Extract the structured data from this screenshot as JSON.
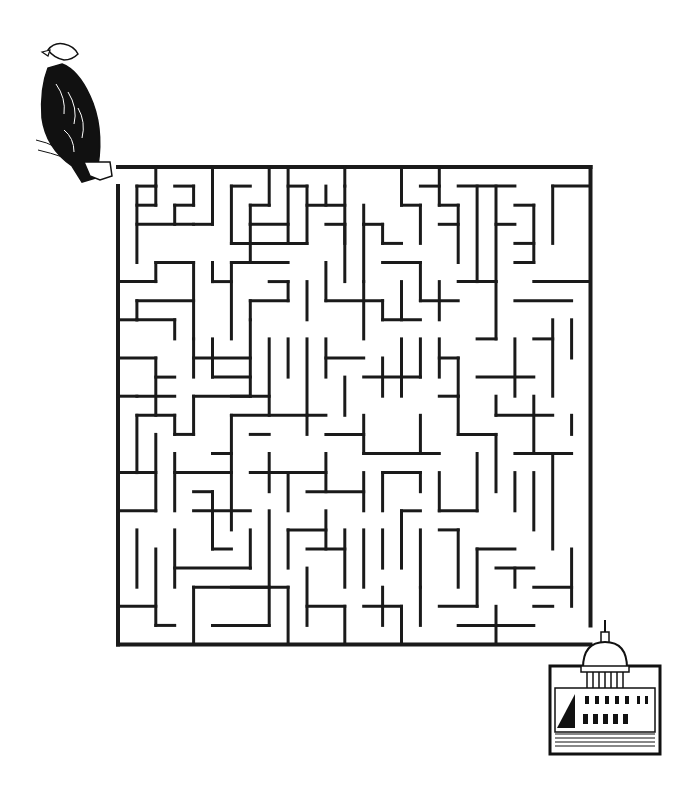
{
  "puzzle": {
    "type": "maze",
    "title": "",
    "start_marker": {
      "icon": "bald-eagle-icon",
      "position": "top-left"
    },
    "end_marker": {
      "icon": "us-capitol-building-icon",
      "position": "bottom-right"
    },
    "grid": {
      "cols": 25,
      "rows": 25,
      "origin_x": 118,
      "origin_y": 167,
      "cell_w": 18.9,
      "cell_h": 19.1
    },
    "colors": {
      "wall": "#1a1a1a",
      "background": "#ffffff"
    },
    "entrance": {
      "side": "left",
      "row": 0
    },
    "exit": {
      "side": "right",
      "row": 24
    },
    "walls": [
      [
        0,
        0,
        25,
        0
      ],
      [
        0,
        1,
        0,
        25
      ],
      [
        0,
        25,
        25,
        25
      ],
      [
        25,
        0,
        25,
        24
      ],
      [
        1,
        1,
        2,
        1
      ],
      [
        1,
        1,
        1,
        5
      ],
      [
        2,
        0,
        2,
        1
      ],
      [
        2,
        1,
        2,
        2
      ],
      [
        1,
        2,
        2,
        2
      ],
      [
        1,
        3,
        4,
        3
      ],
      [
        3,
        1,
        4,
        1
      ],
      [
        4,
        1,
        4,
        2
      ],
      [
        3,
        2,
        4,
        2
      ],
      [
        3,
        2,
        3,
        3
      ],
      [
        5,
        0,
        5,
        3
      ],
      [
        4,
        3,
        5,
        3
      ],
      [
        6,
        1,
        7,
        1
      ],
      [
        6,
        1,
        6,
        4
      ],
      [
        7,
        2,
        8,
        2
      ],
      [
        7,
        2,
        7,
        3
      ],
      [
        8,
        0,
        8,
        2
      ],
      [
        6,
        4,
        10,
        4
      ],
      [
        9,
        0,
        9,
        4
      ],
      [
        9,
        1,
        10,
        1
      ],
      [
        10,
        1,
        10,
        4
      ],
      [
        10,
        2,
        12,
        2
      ],
      [
        11,
        1,
        11,
        2
      ],
      [
        7,
        3,
        9,
        3
      ],
      [
        7,
        3,
        7,
        5
      ],
      [
        12,
        0,
        12,
        1
      ],
      [
        12,
        1,
        12,
        4
      ],
      [
        11,
        3,
        12,
        3
      ],
      [
        12,
        3,
        12,
        6
      ],
      [
        13,
        3,
        14,
        3
      ],
      [
        13,
        2,
        13,
        3
      ],
      [
        13,
        3,
        13,
        6
      ],
      [
        14,
        4,
        14,
        3
      ],
      [
        14,
        4,
        15,
        4
      ],
      [
        15,
        0,
        15,
        2
      ],
      [
        15,
        2,
        16,
        2
      ],
      [
        16,
        2,
        16,
        4
      ],
      [
        16,
        1,
        17,
        1
      ],
      [
        14,
        5,
        16,
        5
      ],
      [
        16,
        5,
        16,
        7
      ],
      [
        17,
        0,
        17,
        2
      ],
      [
        17,
        2,
        18,
        2
      ],
      [
        18,
        2,
        18,
        5
      ],
      [
        17,
        3,
        18,
        3
      ],
      [
        19,
        1,
        19,
        6
      ],
      [
        18,
        1,
        21,
        1
      ],
      [
        20,
        1,
        20,
        6
      ],
      [
        20,
        3,
        21,
        3
      ],
      [
        21,
        2,
        22,
        2
      ],
      [
        22,
        2,
        22,
        5
      ],
      [
        21,
        4,
        22,
        4
      ],
      [
        21,
        5,
        22,
        5
      ],
      [
        23,
        1,
        23,
        4
      ],
      [
        23,
        1,
        25,
        1
      ],
      [
        0,
        6,
        2,
        6
      ],
      [
        2,
        5,
        2,
        6
      ],
      [
        2,
        5,
        4,
        5
      ],
      [
        4,
        5,
        4,
        9
      ],
      [
        1,
        7,
        4,
        7
      ],
      [
        1,
        7,
        1,
        8
      ],
      [
        1,
        8,
        3,
        8
      ],
      [
        3,
        8,
        3,
        9
      ],
      [
        5,
        5,
        5,
        6
      ],
      [
        5,
        6,
        6,
        6
      ],
      [
        6,
        5,
        6,
        9
      ],
      [
        6,
        5,
        9,
        5
      ],
      [
        7,
        7,
        7,
        8
      ],
      [
        7,
        7,
        9,
        7
      ],
      [
        9,
        7,
        9,
        6
      ],
      [
        8,
        6,
        9,
        6
      ],
      [
        11,
        7,
        14,
        7
      ],
      [
        11,
        5,
        11,
        7
      ],
      [
        10,
        6,
        10,
        8
      ],
      [
        13,
        6,
        13,
        9
      ],
      [
        14,
        7,
        14,
        8
      ],
      [
        14,
        8,
        16,
        8
      ],
      [
        15,
        6,
        15,
        8
      ],
      [
        16,
        7,
        18,
        7
      ],
      [
        17,
        6,
        17,
        8
      ],
      [
        18,
        6,
        20,
        6
      ],
      [
        20,
        6,
        20,
        9
      ],
      [
        20,
        9,
        19,
        9
      ],
      [
        21,
        7,
        24,
        7
      ],
      [
        22,
        6,
        25,
        6
      ],
      [
        24,
        8,
        24,
        10
      ],
      [
        0,
        8,
        1,
        8
      ],
      [
        0,
        10,
        2,
        10
      ],
      [
        2,
        10,
        2,
        13
      ],
      [
        2,
        11,
        3,
        11
      ],
      [
        1,
        12,
        3,
        12
      ],
      [
        0,
        12,
        1,
        12
      ],
      [
        4,
        9,
        4,
        11
      ],
      [
        4,
        10,
        7,
        10
      ],
      [
        5,
        9,
        5,
        11
      ],
      [
        5,
        11,
        7,
        11
      ],
      [
        7,
        8,
        7,
        12
      ],
      [
        6,
        12,
        8,
        12
      ],
      [
        8,
        9,
        8,
        13
      ],
      [
        9,
        9,
        9,
        11
      ],
      [
        10,
        9,
        10,
        13
      ],
      [
        11,
        9,
        11,
        11
      ],
      [
        11,
        10,
        13,
        10
      ],
      [
        12,
        11,
        12,
        13
      ],
      [
        14,
        10,
        14,
        12
      ],
      [
        13,
        11,
        16,
        11
      ],
      [
        15,
        9,
        15,
        12
      ],
      [
        16,
        9,
        16,
        11
      ],
      [
        17,
        9,
        17,
        11
      ],
      [
        17,
        10,
        18,
        10
      ],
      [
        18,
        10,
        18,
        12
      ],
      [
        19,
        11,
        22,
        11
      ],
      [
        21,
        9,
        21,
        12
      ],
      [
        22,
        9,
        23,
        9
      ],
      [
        23,
        8,
        23,
        12
      ],
      [
        4,
        12,
        7,
        12
      ],
      [
        4,
        12,
        4,
        14
      ],
      [
        1,
        13,
        3,
        13
      ],
      [
        1,
        13,
        1,
        16
      ],
      [
        3,
        13,
        3,
        14
      ],
      [
        3,
        14,
        4,
        14
      ],
      [
        6,
        13,
        11,
        13
      ],
      [
        6,
        13,
        6,
        19
      ],
      [
        5,
        15,
        6,
        15
      ],
      [
        7,
        14,
        8,
        14
      ],
      [
        10,
        13,
        10,
        14
      ],
      [
        11,
        14,
        13,
        14
      ],
      [
        13,
        13,
        13,
        15
      ],
      [
        13,
        15,
        17,
        15
      ],
      [
        16,
        13,
        16,
        15
      ],
      [
        17,
        12,
        18,
        12
      ],
      [
        18,
        12,
        18,
        14
      ],
      [
        18,
        14,
        20,
        14
      ],
      [
        20,
        12,
        20,
        13
      ],
      [
        20,
        13,
        23,
        13
      ],
      [
        22,
        12,
        22,
        15
      ],
      [
        21,
        15,
        24,
        15
      ],
      [
        24,
        13,
        24,
        14
      ],
      [
        0,
        16,
        2,
        16
      ],
      [
        2,
        14,
        2,
        18
      ],
      [
        3,
        15,
        3,
        18
      ],
      [
        3,
        16,
        6,
        16
      ],
      [
        4,
        17,
        5,
        17
      ],
      [
        5,
        17,
        5,
        20
      ],
      [
        8,
        15,
        8,
        17
      ],
      [
        7,
        16,
        11,
        16
      ],
      [
        9,
        16,
        9,
        18
      ],
      [
        11,
        15,
        11,
        17
      ],
      [
        10,
        17,
        13,
        17
      ],
      [
        13,
        16,
        13,
        18
      ],
      [
        14,
        16,
        16,
        16
      ],
      [
        14,
        16,
        14,
        18
      ],
      [
        16,
        16,
        16,
        17
      ],
      [
        17,
        16,
        17,
        18
      ],
      [
        17,
        18,
        19,
        18
      ],
      [
        19,
        15,
        19,
        18
      ],
      [
        20,
        14,
        20,
        17
      ],
      [
        21,
        16,
        21,
        18
      ],
      [
        22,
        16,
        22,
        19
      ],
      [
        23,
        15,
        23,
        20
      ],
      [
        0,
        18,
        2,
        18
      ],
      [
        1,
        19,
        1,
        22
      ],
      [
        2,
        20,
        2,
        24
      ],
      [
        3,
        19,
        3,
        22
      ],
      [
        3,
        21,
        7,
        21
      ],
      [
        4,
        18,
        7,
        18
      ],
      [
        7,
        19,
        7,
        21
      ],
      [
        5,
        20,
        6,
        20
      ],
      [
        6,
        22,
        8,
        22
      ],
      [
        8,
        18,
        8,
        24
      ],
      [
        9,
        19,
        9,
        21
      ],
      [
        9,
        19,
        11,
        19
      ],
      [
        11,
        18,
        11,
        20
      ],
      [
        10,
        20,
        12,
        20
      ],
      [
        12,
        19,
        12,
        22
      ],
      [
        13,
        19,
        13,
        22
      ],
      [
        14,
        19,
        14,
        21
      ],
      [
        15,
        18,
        16,
        18
      ],
      [
        15,
        18,
        15,
        21
      ],
      [
        16,
        19,
        16,
        22
      ],
      [
        17,
        19,
        18,
        19
      ],
      [
        18,
        19,
        18,
        22
      ],
      [
        19,
        20,
        21,
        20
      ],
      [
        19,
        20,
        19,
        23
      ],
      [
        20,
        21,
        22,
        21
      ],
      [
        21,
        21,
        21,
        22
      ],
      [
        22,
        22,
        24,
        22
      ],
      [
        24,
        20,
        24,
        23
      ],
      [
        0,
        23,
        2,
        23
      ],
      [
        2,
        24,
        3,
        24
      ],
      [
        4,
        22,
        4,
        25
      ],
      [
        4,
        22,
        9,
        22
      ],
      [
        5,
        24,
        8,
        24
      ],
      [
        9,
        22,
        9,
        25
      ],
      [
        10,
        21,
        10,
        24
      ],
      [
        10,
        23,
        12,
        23
      ],
      [
        12,
        23,
        12,
        25
      ],
      [
        13,
        23,
        15,
        23
      ],
      [
        14,
        22,
        14,
        24
      ],
      [
        15,
        23,
        15,
        25
      ],
      [
        16,
        22,
        16,
        24
      ],
      [
        17,
        23,
        19,
        23
      ],
      [
        18,
        24,
        22,
        24
      ],
      [
        20,
        23,
        20,
        25
      ],
      [
        22,
        23,
        23,
        23
      ]
    ]
  }
}
